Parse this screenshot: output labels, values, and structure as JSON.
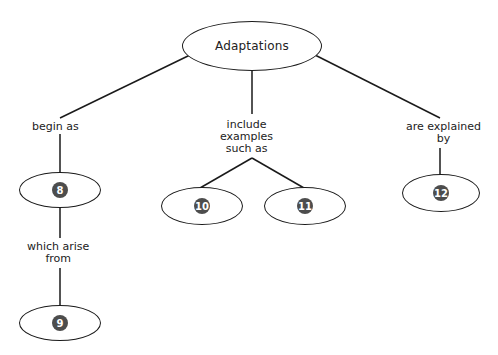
{
  "diagram": {
    "type": "concept-map",
    "root": {
      "label": "Adaptations"
    },
    "branches": [
      {
        "link": "begin as",
        "node": {
          "badge": "8"
        },
        "child_link": "which arise from",
        "child_node": {
          "badge": "9"
        }
      },
      {
        "link": "include examples such as",
        "nodes": [
          {
            "badge": "10"
          },
          {
            "badge": "11"
          }
        ]
      },
      {
        "link": "are explained by",
        "node": {
          "badge": "12"
        }
      }
    ]
  },
  "links": {
    "begin_as": "begin as",
    "include_line1": "include",
    "include_line2": "examples",
    "include_line3": "such as",
    "explained_line1": "are explained",
    "explained_line2": "by",
    "arise_line1": "which arise",
    "arise_line2": "from"
  },
  "nodes": {
    "root": "Adaptations",
    "n8": "8",
    "n9": "9",
    "n10": "10",
    "n11": "11",
    "n12": "12"
  },
  "colors": {
    "line": "#1a1a1a",
    "badge": "#4d4d4d"
  }
}
